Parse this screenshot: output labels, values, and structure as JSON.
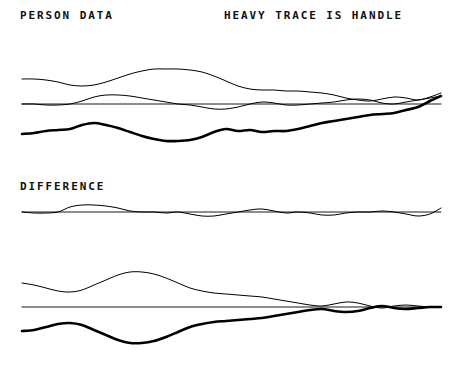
{
  "page": {
    "background_color": "#ffffff",
    "ink_color": "#000000",
    "width": 457,
    "height": 372
  },
  "labels": {
    "person_data": "PERSON DATA",
    "heavy_trace": "HEAVY TRACE IS HANDLE",
    "difference": "DIFFERENCE"
  },
  "chart_data": {
    "type": "line",
    "title": "PERSON DATA",
    "subtitle": "HEAVY TRACE IS HANDLE",
    "xlabel": "",
    "ylabel": "",
    "grid": false,
    "legend": "none",
    "annotations": [
      "PERSON DATA",
      "HEAVY TRACE IS HANDLE",
      "DIFFERENCE"
    ],
    "panels": [
      {
        "name": "person-data-panel",
        "label": "PERSON DATA",
        "baseline_y": 104,
        "x_range": [
          22,
          441
        ],
        "series": [
          {
            "name": "upper-thin-trace",
            "style": "thin",
            "x": [
              22,
              34,
              46,
              58,
              70,
              82,
              94,
              106,
              118,
              130,
              142,
              154,
              166,
              178,
              190,
              202,
              214,
              226,
              238,
              250,
              262,
              274,
              286,
              298,
              310,
              322,
              334,
              346,
              358,
              370,
              382,
              394,
              406,
              418,
              430,
              441
            ],
            "y": [
              79,
              79,
              80,
              82,
              85,
              86,
              85,
              82,
              78,
              74,
              71,
              69,
              69,
              69,
              70,
              72,
              76,
              81,
              86,
              89,
              90,
              90,
              91,
              91,
              92,
              93,
              95,
              98,
              100,
              101,
              99,
              97,
              98,
              100,
              97,
              93
            ]
          },
          {
            "name": "middle-thin-oscillation",
            "style": "thin",
            "x": [
              22,
              34,
              46,
              58,
              70,
              82,
              94,
              106,
              118,
              130,
              142,
              154,
              166,
              178,
              190,
              202,
              214,
              226,
              238,
              250,
              262,
              274,
              286,
              298,
              310,
              322,
              334,
              346,
              358,
              370,
              382,
              394,
              406,
              418,
              430,
              441
            ],
            "y": [
              104,
              104,
              105,
              105,
              104,
              101,
              97,
              95,
              95,
              96,
              98,
              100,
              102,
              104,
              105,
              107,
              109,
              109,
              107,
              104,
              102,
              103,
              105,
              105,
              104,
              103,
              102,
              100,
              99,
              100,
              103,
              104,
              102,
              100,
              98,
              96
            ]
          },
          {
            "name": "baseline",
            "style": "baseline",
            "x": [
              22,
              441
            ],
            "y": [
              104,
              104
            ]
          },
          {
            "name": "handle-heavy-trace",
            "style": "heavy",
            "x": [
              22,
              34,
              46,
              58,
              70,
              82,
              94,
              106,
              118,
              130,
              142,
              154,
              166,
              178,
              190,
              202,
              214,
              226,
              238,
              250,
              262,
              274,
              286,
              298,
              310,
              322,
              334,
              346,
              358,
              370,
              382,
              394,
              406,
              418,
              430,
              441
            ],
            "y": [
              134,
              133,
              131,
              130,
              129,
              125,
              123,
              125,
              128,
              132,
              136,
              139,
              141,
              141,
              140,
              137,
              132,
              129,
              131,
              130,
              132,
              131,
              131,
              129,
              126,
              123,
              121,
              119,
              117,
              115,
              114,
              113,
              110,
              107,
              101,
              96
            ]
          }
        ]
      },
      {
        "name": "difference-panel",
        "label": "DIFFERENCE",
        "baseline_y": 212,
        "x_range": [
          22,
          441
        ],
        "series": [
          {
            "name": "baseline",
            "style": "baseline",
            "x": [
              22,
              441
            ],
            "y": [
              212,
              212
            ]
          },
          {
            "name": "difference-thin-trace",
            "style": "thin",
            "x": [
              22,
              34,
              46,
              58,
              70,
              82,
              94,
              106,
              118,
              130,
              142,
              154,
              166,
              178,
              190,
              202,
              214,
              226,
              238,
              250,
              262,
              274,
              286,
              298,
              310,
              322,
              334,
              346,
              358,
              370,
              382,
              394,
              406,
              418,
              430,
              441
            ],
            "y": [
              212,
              213,
              213,
              212,
              207,
              205,
              205,
              206,
              208,
              211,
              212,
              212,
              213,
              212,
              214,
              216,
              216,
              214,
              212,
              210,
              209,
              211,
              213,
              212,
              213,
              215,
              215,
              213,
              212,
              212,
              211,
              212,
              214,
              216,
              214,
              208
            ]
          }
        ]
      },
      {
        "name": "lower-panel",
        "label": "",
        "baseline_y": 307,
        "x_range": [
          22,
          441
        ],
        "series": [
          {
            "name": "upper-thin-trace",
            "style": "thin",
            "x": [
              22,
              34,
              46,
              58,
              70,
              82,
              94,
              106,
              118,
              130,
              142,
              154,
              166,
              178,
              190,
              202,
              214,
              226,
              238,
              250,
              262,
              274,
              286,
              298,
              310,
              322,
              334,
              346,
              358,
              370,
              382,
              394,
              406,
              418,
              430,
              441
            ],
            "y": [
              283,
              285,
              288,
              291,
              292,
              290,
              285,
              280,
              275,
              272,
              272,
              274,
              278,
              283,
              288,
              291,
              293,
              294,
              295,
              296,
              297,
              299,
              301,
              303,
              305,
              306,
              304,
              302,
              303,
              306,
              308,
              306,
              305,
              306,
              307,
              307
            ]
          },
          {
            "name": "baseline",
            "style": "baseline",
            "x": [
              22,
              441
            ],
            "y": [
              307,
              307
            ]
          },
          {
            "name": "handle-heavy-trace",
            "style": "heavy",
            "x": [
              22,
              34,
              46,
              58,
              70,
              82,
              94,
              106,
              118,
              130,
              142,
              154,
              166,
              178,
              190,
              202,
              214,
              226,
              238,
              250,
              262,
              274,
              286,
              298,
              310,
              322,
              334,
              346,
              358,
              370,
              382,
              394,
              406,
              418,
              430,
              441
            ],
            "y": [
              331,
              330,
              327,
              324,
              323,
              325,
              330,
              335,
              340,
              343,
              343,
              341,
              337,
              332,
              327,
              324,
              322,
              321,
              320,
              319,
              318,
              316,
              314,
              312,
              310,
              309,
              311,
              312,
              311,
              308,
              306,
              308,
              309,
              308,
              307,
              307
            ]
          }
        ]
      }
    ]
  }
}
